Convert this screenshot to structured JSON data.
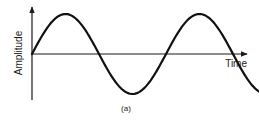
{
  "figure": {
    "caption": "(a)"
  },
  "chart_data": {
    "type": "line",
    "title": "",
    "xlabel": "Time",
    "ylabel": "Amplitude",
    "series": [
      {
        "name": "sine-wave",
        "function": "sin",
        "cycles": 1.75,
        "start_phase_deg": 0,
        "amplitude": 1
      }
    ],
    "xlim": [
      0,
      1.75
    ],
    "ylim": [
      -1,
      1
    ],
    "x_units": "cycles",
    "grid": false,
    "legend": "none",
    "tick_labels": false
  }
}
